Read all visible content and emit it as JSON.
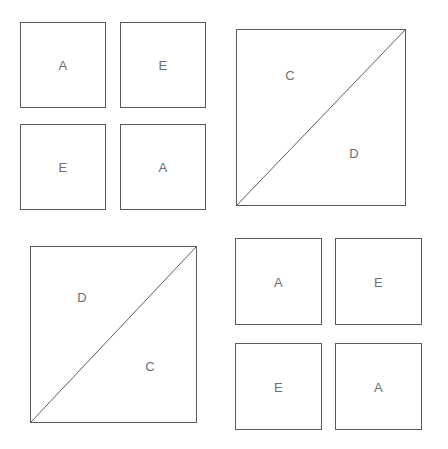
{
  "canvas": {
    "width": 448,
    "height": 449,
    "background": "#ffffff",
    "stroke_color": "#5a5a5a",
    "label_color": "#6d6d6d"
  },
  "figures": [
    {
      "id": "figure-top-left",
      "type": "grid-of-squares",
      "position": {
        "x": 0,
        "y": 0,
        "width": 224,
        "height": 224
      },
      "cells": [
        {
          "label": "A",
          "x": 20,
          "y": 22,
          "width": 86,
          "height": 86
        },
        {
          "label": "E",
          "x": 120,
          "y": 22,
          "width": 86,
          "height": 86
        },
        {
          "label": "E",
          "x": 20,
          "y": 124,
          "width": 86,
          "height": 86
        },
        {
          "label": "A",
          "x": 120,
          "y": 124,
          "width": 86,
          "height": 86
        }
      ]
    },
    {
      "id": "figure-top-right",
      "type": "diagonal-square",
      "position": {
        "x": 236,
        "y": 29,
        "width": 170,
        "height": 177
      },
      "diagonal": "bottom-left-to-top-right",
      "triangles": [
        {
          "label": "C",
          "region": "upper-left",
          "cx": 53,
          "cy": 45
        },
        {
          "label": "D",
          "region": "lower-right",
          "cx": 117,
          "cy": 123
        }
      ]
    },
    {
      "id": "figure-bottom-left",
      "type": "diagonal-square",
      "position": {
        "x": 30,
        "y": 246,
        "width": 167,
        "height": 177
      },
      "diagonal": "bottom-left-to-top-right",
      "triangles": [
        {
          "label": "D",
          "region": "upper-left",
          "cx": 51,
          "cy": 50
        },
        {
          "label": "C",
          "region": "lower-right",
          "cx": 119,
          "cy": 119
        }
      ]
    },
    {
      "id": "figure-bottom-right",
      "type": "grid-of-squares",
      "position": {
        "x": 224,
        "y": 224,
        "width": 224,
        "height": 225
      },
      "cells": [
        {
          "label": "A",
          "x": 235,
          "y": 238,
          "width": 87,
          "height": 87
        },
        {
          "label": "E",
          "x": 335,
          "y": 238,
          "width": 87,
          "height": 87
        },
        {
          "label": "E",
          "x": 235,
          "y": 343,
          "width": 87,
          "height": 87
        },
        {
          "label": "A",
          "x": 335,
          "y": 343,
          "width": 87,
          "height": 87
        }
      ]
    }
  ]
}
